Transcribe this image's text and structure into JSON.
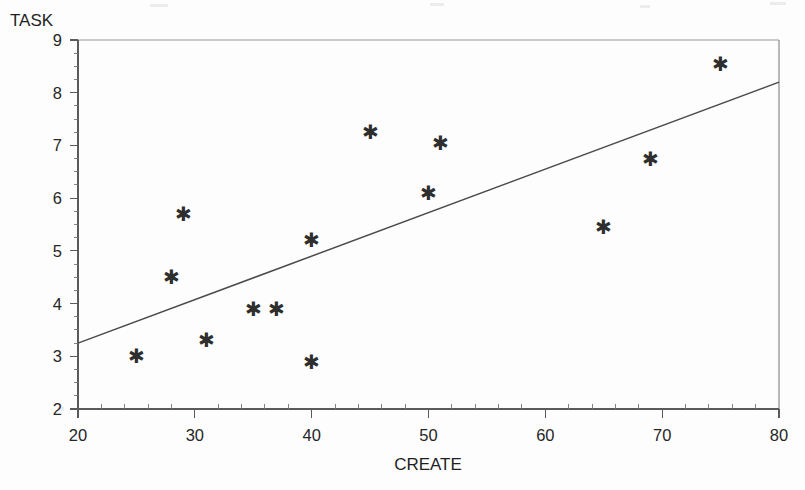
{
  "chart_data": {
    "type": "scatter",
    "title": "",
    "xlabel": "CREATE",
    "ylabel": "TASK",
    "xlim": [
      20,
      80
    ],
    "ylim": [
      2,
      9
    ],
    "grid": false,
    "legend": null,
    "x_ticks": [
      20,
      30,
      40,
      50,
      60,
      70,
      80
    ],
    "x_tick_labels": [
      "20",
      "30",
      "40",
      "50",
      "60",
      "70",
      "80"
    ],
    "y_ticks": [
      2,
      3,
      4,
      5,
      6,
      7,
      8,
      9
    ],
    "y_tick_labels": [
      "2",
      "3",
      "4",
      "5",
      "6",
      "7",
      "8",
      "9"
    ],
    "x_minor_step": 2,
    "y_minor_step": 0.25,
    "marker": "asterisk",
    "marker_glyph": "✱",
    "marker_color": "#2e2e2e",
    "points": [
      {
        "x": 25.0,
        "y": 3.0
      },
      {
        "x": 28.0,
        "y": 4.5
      },
      {
        "x": 29.0,
        "y": 5.7
      },
      {
        "x": 31.0,
        "y": 3.3
      },
      {
        "x": 35.0,
        "y": 3.9
      },
      {
        "x": 37.0,
        "y": 3.9
      },
      {
        "x": 40.0,
        "y": 5.2
      },
      {
        "x": 40.0,
        "y": 2.9
      },
      {
        "x": 45.0,
        "y": 7.25
      },
      {
        "x": 50.0,
        "y": 6.1
      },
      {
        "x": 51.0,
        "y": 7.05
      },
      {
        "x": 65.0,
        "y": 5.45
      },
      {
        "x": 69.0,
        "y": 6.75
      },
      {
        "x": 75.0,
        "y": 8.55
      }
    ],
    "trend_line": {
      "type": "linear-fit",
      "x_start": 20,
      "y_start": 3.25,
      "x_end": 80,
      "y_end": 8.2,
      "color": "#4a4a4a"
    }
  },
  "colors": {
    "background": "#fdfdfd",
    "axis": "#5a5a5a",
    "text": "#1f1f1f",
    "marker": "#2e2e2e",
    "trend": "#4a4a4a",
    "frame_top": "#b9b9b9"
  }
}
